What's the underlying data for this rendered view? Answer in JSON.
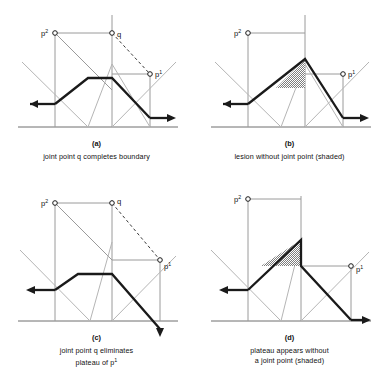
{
  "figure": {
    "title": "",
    "width": 386,
    "height": 387,
    "background": "#ffffff"
  },
  "colors": {
    "heavy_line": "#1a1a1a",
    "light_line": "#9a9a9a",
    "medium_line": "#6e6e6e",
    "shade_fill": "#8a8a8a",
    "text": "#111111"
  },
  "labels": {
    "p2": "p",
    "p2_sup": "2",
    "p1": "p",
    "p1_sup": "1",
    "q": "q"
  },
  "panels": [
    {
      "id": "a",
      "letter": "(a)",
      "caption_line1": "joint point q completes boundary",
      "caption_line2": "",
      "has_q": true,
      "has_shading": false,
      "label_p2": "p2",
      "label_p1": "p1",
      "label_q": "q"
    },
    {
      "id": "b",
      "letter": "(b)",
      "caption_line1": "lesion without joint point (shaded)",
      "caption_line2": "",
      "has_q": false,
      "has_shading": true,
      "label_p2": "p2",
      "label_p1": "p1",
      "label_q": ""
    },
    {
      "id": "c",
      "letter": "(c)",
      "caption_line1": "joint point q eliminates",
      "caption_line2": "plateau of p",
      "caption_line2_sup": "1",
      "has_q": true,
      "has_shading": false,
      "label_p2": "p2",
      "label_p1": "p1",
      "label_q": "q"
    },
    {
      "id": "d",
      "letter": "(d)",
      "caption_line1": "plateau appears without",
      "caption_line2": "a joint point (shaded)",
      "has_q": false,
      "has_shading": true,
      "label_p2": "p2",
      "label_p1": "p1",
      "label_q": ""
    }
  ]
}
